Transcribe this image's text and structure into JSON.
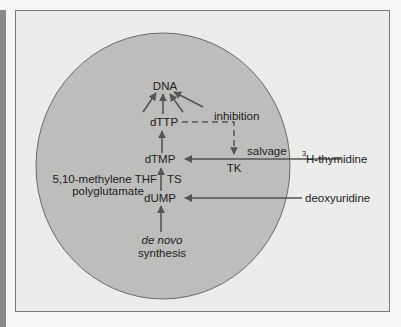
{
  "diagram": {
    "nodes": {
      "dna": "DNA",
      "dttp": "dTTP",
      "dtmp": "dTMP",
      "dump": "dUMP",
      "de_novo": "de novo",
      "synthesis": "synthesis"
    },
    "enzymes": {
      "ts": "TS",
      "tk": "TK"
    },
    "cofactor": {
      "line1": "5,10-methylene THF",
      "line2": "polyglutamate"
    },
    "annotations": {
      "inhibition": "inhibition",
      "salvage": "salvage"
    },
    "external_inputs": {
      "thymidine_superscript": "3",
      "thymidine": "H-thymidine",
      "deoxyuridine": "deoxyuridine"
    },
    "colors": {
      "cell_fill": "#bdbdbc",
      "background": "#ececeb",
      "line": "#555555",
      "text": "#222222"
    }
  }
}
